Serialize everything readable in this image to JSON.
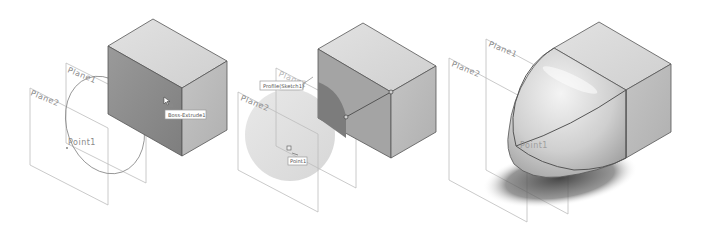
{
  "figure": {
    "panels": [
      {
        "id": "panel-1",
        "description": "Box extrude with sketch ellipse and reference planes",
        "labels": {
          "plane1": "Plane1",
          "plane2": "Plane2",
          "point": "Point1"
        },
        "tooltip": "Boss-Extrude1"
      },
      {
        "id": "panel-2",
        "description": "Selecting profile sketch and point for loft",
        "labels": {
          "plane1": "Plane1",
          "plane2": "Plane2",
          "point": "Point1"
        },
        "tooltip_profile": "Profile(Sketch1)",
        "tooltip_point": "Point1"
      },
      {
        "id": "panel-3",
        "description": "Result: lofted dome to point merged with box",
        "labels": {
          "plane1": "Plane1",
          "plane2": "Plane2",
          "point": "Point1"
        }
      }
    ],
    "colors": {
      "background": "#ffffff",
      "plane_line": "#bdbdbd",
      "edge": "#555555",
      "box_top": "#d8d8d8",
      "box_front": "#8e8e8e",
      "box_side": "#b9b9b9",
      "shadow": "#5a5a5a"
    }
  }
}
